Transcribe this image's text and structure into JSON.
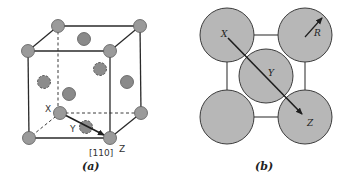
{
  "panel_a": {
    "caption": "(a)",
    "structure": "face-centered cubic unit cell",
    "labels": {
      "x": "X",
      "y": "Y",
      "z": "Z",
      "direction": "[110]"
    }
  },
  "panel_b": {
    "caption": "(b)",
    "structure": "close-packed (100) face view",
    "labels": {
      "x": "X",
      "y": "Y",
      "z": "Z",
      "radius": "R"
    }
  },
  "colors": {
    "atom_fill_a": "#9a9a9a",
    "atom_fill_b": "#b7b7b7",
    "line": "#2a2a2a"
  }
}
